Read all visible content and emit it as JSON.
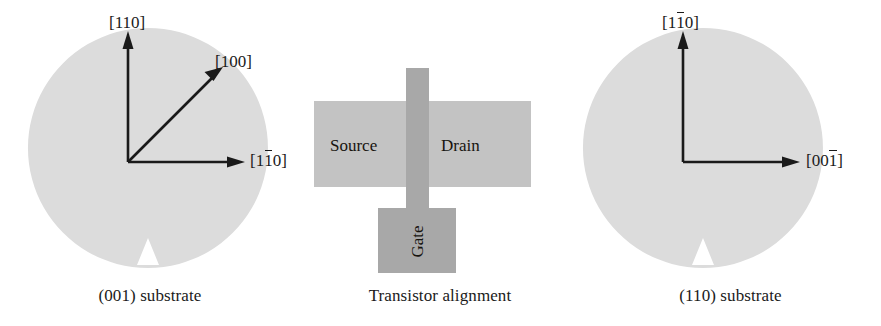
{
  "figure": {
    "panels": [
      {
        "id": "left",
        "caption": "(001) substrate",
        "wafer_color": "#dcdcdc",
        "axes": [
          {
            "name": "vertical",
            "label_pre": "[110]",
            "label_bar": "",
            "label_post": ""
          },
          {
            "name": "diagonal",
            "label_pre": "[100]",
            "label_bar": "",
            "label_post": ""
          },
          {
            "name": "horizontal",
            "label_pre": "[1",
            "label_bar": "1",
            "label_post": "0]"
          }
        ]
      },
      {
        "id": "center",
        "caption": "Transistor alignment",
        "source_label": "Source",
        "drain_label": "Drain",
        "gate_label": "Gate",
        "contact_color": "#c3c3c3",
        "gate_color": "#a8a8a8"
      },
      {
        "id": "right",
        "caption": "(110) substrate",
        "wafer_color": "#dcdcdc",
        "axes": [
          {
            "name": "vertical",
            "label_pre": "[1",
            "label_bar": "1",
            "label_post": "0]"
          },
          {
            "name": "horizontal",
            "label_pre": "[00",
            "label_bar": "1",
            "label_post": "]"
          }
        ]
      }
    ],
    "colors": {
      "wafer": "#dcdcdc",
      "arrow": "#1a1a1a",
      "text": "#1a1a1a",
      "contact": "#c3c3c3",
      "gate": "#a8a8a8",
      "background": "#ffffff"
    }
  }
}
